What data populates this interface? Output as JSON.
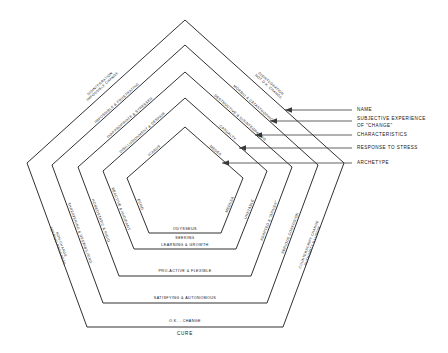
{
  "diagram": {
    "shape": "pentagon",
    "ring_count": 5,
    "stroke_color": "#1a1a1a",
    "background_color": "#ffffff"
  },
  "callouts": [
    {
      "id": "name",
      "label": "NAME"
    },
    {
      "id": "subjective",
      "label": "SUBJECTIVE EXPERIENCE",
      "label2": "OF \"CHANGE\""
    },
    {
      "id": "characteristics",
      "label": "CHARACTERISTICS"
    },
    {
      "id": "response",
      "label": "RESPONSE TO STRESS"
    },
    {
      "id": "archetype",
      "label": "ARCHETYPE"
    }
  ],
  "rings": [
    {
      "id": "ring-1-name",
      "row": "NAME",
      "upper_left": {
        "line1": "DISINTEGRATION",
        "line2": "IMPOSSIBLE CHANGE"
      },
      "upper_right": {
        "line1": "DISINTEGRATION",
        "line2": "NOT O.K. CHANGE"
      },
      "lower_left": {
        "line1": "NON-CHANGE",
        "line2": "FEARING PROGRESS"
      },
      "lower_right": {
        "line1": "COUNTERSCRIPT CHANGE",
        "line2": "AUTHORITY ILLUSION"
      },
      "bottom": {
        "line1": "O.K. - CHANGE",
        "line2": "CURE"
      }
    },
    {
      "id": "ring-2-subjective",
      "row": "SUBJECTIVE EXPERIENCE OF \"CHANGE\"",
      "upper_left": {
        "line1": "IMPOSSIBLE & FRUSTRATING"
      },
      "upper_right": {
        "line1": "MORBID & CATASTROPHIC"
      },
      "lower_left": {
        "line1": "THREATENING & DESTABILISING"
      },
      "lower_right": {
        "line1": "SERIOUS CONFUSION"
      },
      "bottom": {
        "line1": "SATISFYING & AUTONOMOUS"
      }
    },
    {
      "id": "ring-3-characteristics",
      "row": "CHARACTERISTICS",
      "upper_left": {
        "line1": "INAPPROPRIATE & STRESSED"
      },
      "upper_right": {
        "line1": "DESTRUCTIVE & DISINTEGRATING"
      },
      "lower_left": {
        "line1": "HOMEOSTATIC & RIGID"
      },
      "lower_right": {
        "line1": "ADAPTED & \"DRIVEN\""
      },
      "bottom": {
        "line1": "PRO-ACTIVE & FLEXIBLE"
      }
    },
    {
      "id": "ring-4-response",
      "row": "RESPONSE TO STRESS",
      "upper_left": {
        "line1": "DISILLUSIONMENT & DESPAIR"
      },
      "upper_right": {
        "line1": "CASUALTY"
      },
      "lower_left": {
        "line1": "REACTIVE & AVOIDANT"
      },
      "lower_right": {
        "line1": "UNSTABLE"
      },
      "bottom": {
        "line1": "SEEKING",
        "line2": "LEARNING & GROWTH"
      }
    },
    {
      "id": "ring-5-archetype",
      "row": "ARCHETYPE",
      "upper_left": {
        "line1": "ICARUS"
      },
      "upper_right": {
        "line1": "MEDEA"
      },
      "lower_left": {
        "line1": "ECHO"
      },
      "lower_right": {
        "line1": "MEDUSA"
      },
      "bottom": {
        "line1": "ODYSSEUS"
      }
    }
  ]
}
